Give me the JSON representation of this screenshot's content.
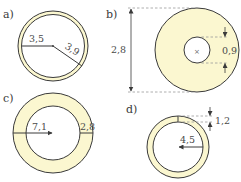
{
  "colors": {
    "ring_fill": "#fbf7d0",
    "stroke": "#3a3a3a",
    "dash": "#9a9a9a",
    "background": "#ffffff"
  },
  "figures": [
    {
      "label": "a)",
      "inner_label": "3,5",
      "outer_label": "3,9"
    },
    {
      "label": "b)",
      "outer_diameter_label": "2,8",
      "inner_diameter_label": "0,9",
      "center_mark": "×"
    },
    {
      "label": "c)",
      "inner_label": "7,1",
      "width_label": "2,8"
    },
    {
      "label": "d)",
      "width_label": "1,2",
      "inner_label": "4,5"
    }
  ]
}
